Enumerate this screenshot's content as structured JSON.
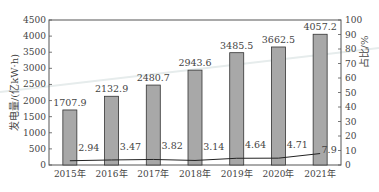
{
  "chart_data": {
    "type": "bar",
    "title": "",
    "categories": [
      "2015年",
      "2016年",
      "2017年",
      "2018年",
      "2019年",
      "2020年",
      "2021年"
    ],
    "series": [
      {
        "name": "发电量",
        "type": "bar",
        "axis": "left",
        "values": [
          1707.9,
          2132.9,
          2480.7,
          2943.6,
          3485.5,
          3662.5,
          4057.2
        ],
        "labels": [
          "1707.9",
          "2132.9",
          "2480.7",
          "2943.6",
          "3485.5",
          "3662.5",
          "4057.2"
        ],
        "color": "#a8a8a8"
      },
      {
        "name": "占比",
        "type": "line",
        "axis": "right",
        "values": [
          2.94,
          3.47,
          3.82,
          3.14,
          4.64,
          4.71,
          7.9
        ],
        "labels": [
          "2.94",
          "3.47",
          "3.82",
          "3.14",
          "4.64",
          "4.71",
          "7.9"
        ],
        "color": "#222222"
      }
    ],
    "ylabel": "发电量/(亿kW·h)",
    "ylabel_right": "占比/%",
    "xlabel": "",
    "ylim": [
      0,
      4500
    ],
    "ylim_right": [
      0,
      100
    ],
    "yticks": [
      "0",
      "500",
      "1000",
      "1500",
      "2000",
      "2500",
      "3000",
      "3500",
      "4000",
      "4500"
    ],
    "yticks_right": [
      "0",
      "10",
      "20",
      "30",
      "40",
      "50",
      "60",
      "70",
      "80",
      "90",
      "100"
    ],
    "grid": false,
    "legend": "none"
  }
}
